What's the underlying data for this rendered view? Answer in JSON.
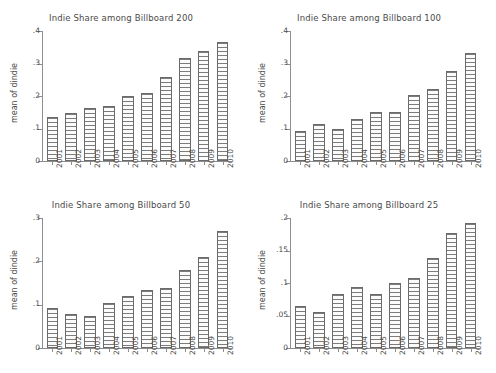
{
  "figure": {
    "ylabel": "mean of dindie",
    "years": [
      "2001",
      "2002",
      "2003",
      "2004",
      "2005",
      "2006",
      "2007",
      "2008",
      "2009",
      "2010"
    ]
  },
  "chart_data": [
    {
      "type": "bar",
      "title": "Indie Share among Billboard 200",
      "xlabel": "",
      "ylabel": "mean of dindie",
      "categories": [
        "2001",
        "2002",
        "2003",
        "2004",
        "2005",
        "2006",
        "2007",
        "2008",
        "2009",
        "2010"
      ],
      "values": [
        0.135,
        0.149,
        0.163,
        0.17,
        0.201,
        0.21,
        0.26,
        0.317,
        0.338,
        0.365
      ],
      "ylim": [
        0,
        0.4
      ],
      "yticks": [
        0,
        0.1,
        0.2,
        0.3,
        0.4
      ],
      "ytick_labels": [
        "0",
        ".1",
        ".2",
        ".3",
        ".4"
      ],
      "grid": false,
      "legend": false
    },
    {
      "type": "bar",
      "title": "Indie Share among Billboard 100",
      "xlabel": "",
      "ylabel": "mean of dindie",
      "categories": [
        "2001",
        "2002",
        "2003",
        "2004",
        "2005",
        "2006",
        "2007",
        "2008",
        "2009",
        "2010"
      ],
      "values": [
        0.093,
        0.114,
        0.099,
        0.129,
        0.15,
        0.152,
        0.203,
        0.221,
        0.276,
        0.331
      ],
      "ylim": [
        0,
        0.4
      ],
      "yticks": [
        0,
        0.1,
        0.2,
        0.3,
        0.4
      ],
      "ytick_labels": [
        "0",
        ".1",
        ".2",
        ".3",
        ".4"
      ],
      "grid": false,
      "legend": false
    },
    {
      "type": "bar",
      "title": "Indie Share among Billboard 50",
      "xlabel": "",
      "ylabel": "mean of dindie",
      "categories": [
        "2001",
        "2002",
        "2003",
        "2004",
        "2005",
        "2006",
        "2007",
        "2008",
        "2009",
        "2010"
      ],
      "values": [
        0.093,
        0.079,
        0.075,
        0.105,
        0.12,
        0.133,
        0.139,
        0.18,
        0.211,
        0.27
      ],
      "ylim": [
        0,
        0.3
      ],
      "yticks": [
        0,
        0.1,
        0.2,
        0.3
      ],
      "ytick_labels": [
        "0",
        ".1",
        ".2",
        ".3"
      ],
      "grid": false,
      "legend": false
    },
    {
      "type": "bar",
      "title": "Indie Share among Billboard 25",
      "xlabel": "",
      "ylabel": "mean of dindie",
      "categories": [
        "2001",
        "2002",
        "2003",
        "2004",
        "2005",
        "2006",
        "2007",
        "2008",
        "2009",
        "2010"
      ],
      "values": [
        0.065,
        0.056,
        0.083,
        0.094,
        0.083,
        0.1,
        0.107,
        0.138,
        0.177,
        0.193
      ],
      "ylim": [
        0,
        0.2
      ],
      "yticks": [
        0,
        0.05,
        0.1,
        0.15,
        0.2
      ],
      "ytick_labels": [
        "0",
        ".05",
        ".1",
        ".15",
        ".2"
      ],
      "grid": false,
      "legend": false
    }
  ]
}
